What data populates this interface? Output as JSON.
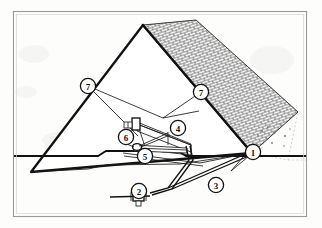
{
  "figure": {
    "title": "Pyramid structure cutaway with numbered callouts",
    "background_color": "#fdfdfc",
    "line_color": "#111111",
    "frame_color": "#9a9a9a",
    "callouts": [
      {
        "id": "callout-1",
        "number": "1",
        "x": 253,
        "y": 152,
        "r": 7.6,
        "note": "right toe of pyramid where mesh face meets ground"
      },
      {
        "id": "callout-2",
        "number": "2",
        "x": 139,
        "y": 191,
        "r": 7.6,
        "note": "ground level valve on buried pipe"
      },
      {
        "id": "callout-3",
        "number": "3",
        "x": 216,
        "y": 185,
        "r": 7.6,
        "note": "buried pipe run crossing under the pile"
      },
      {
        "id": "callout-4",
        "number": "4",
        "x": 178,
        "y": 128,
        "r": 7.6,
        "note": "inclined conveyor boom"
      },
      {
        "id": "callout-5",
        "number": "5",
        "x": 145,
        "y": 156,
        "r": 7.6,
        "note": "lower drive unit at base of boom"
      },
      {
        "id": "callout-6",
        "number": "6",
        "x": 126,
        "y": 137,
        "r": 7.6,
        "note": "head end housing of boom"
      },
      {
        "id": "callout-7a",
        "number": "7",
        "x": 88,
        "y": 86,
        "r": 7.6,
        "note": "left slope break line"
      },
      {
        "id": "callout-7b",
        "number": "7",
        "x": 201,
        "y": 92,
        "r": 7.6,
        "note": "right slope break line"
      }
    ],
    "geometry": {
      "pyramid_apex": [
        143,
        25
      ],
      "pyramid_left_toe": [
        31,
        172
      ],
      "pyramid_right_toe": [
        252,
        153
      ],
      "ground_line_y": 156
    }
  }
}
